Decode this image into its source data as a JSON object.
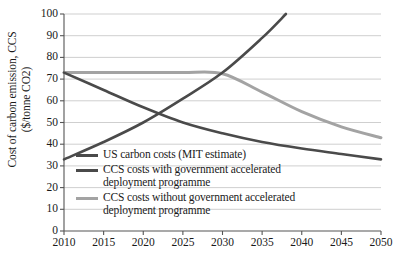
{
  "chart_data": {
    "type": "line",
    "title": "",
    "xlabel": "",
    "ylabel": "Cost of carbon emission, CCS\n($/tonne CO2)",
    "xlim": [
      2010,
      2050
    ],
    "ylim": [
      0,
      100
    ],
    "grid": true,
    "legend_position": "inside-lower-left",
    "xticks": [
      "2010",
      "2015",
      "2020",
      "2025",
      "2030",
      "2035",
      "2040",
      "2045",
      "2050"
    ],
    "yticks": [
      "0",
      "10",
      "20",
      "30",
      "40",
      "50",
      "60",
      "70",
      "80",
      "90",
      "100"
    ],
    "series": [
      {
        "name": "US carbon costs (MIT estimate)",
        "color": "#4a4a4a",
        "width": 2.6,
        "x": [
          2010,
          2015,
          2020,
          2025,
          2030,
          2035,
          2038
        ],
        "values": [
          33,
          41,
          50,
          61,
          73,
          89,
          100
        ]
      },
      {
        "name": "CCS costs with government accelerated\ndeployment programme",
        "color": "#4a4a4a",
        "width": 2.6,
        "x": [
          2010,
          2015,
          2020,
          2025,
          2030,
          2035,
          2040,
          2045,
          2050
        ],
        "values": [
          73,
          65,
          57,
          50,
          45,
          41,
          38,
          35.5,
          33
        ]
      },
      {
        "name": "CCS costs without government accelerated\ndeployment programme",
        "color": "#a3a3a3",
        "width": 3.0,
        "x": [
          2010,
          2015,
          2020,
          2025,
          2030,
          2035,
          2040,
          2045,
          2050
        ],
        "values": [
          73,
          73,
          73,
          73,
          72.5,
          64,
          55,
          48,
          43
        ]
      }
    ]
  },
  "legend": {
    "items": [
      {
        "label": "US carbon costs (MIT estimate)",
        "color": "#4a4a4a"
      },
      {
        "label": "CCS costs with government accelerated\ndeployment programme",
        "color": "#4a4a4a"
      },
      {
        "label": "CCS costs without government accelerated\ndeployment programme",
        "color": "#a3a3a3"
      }
    ]
  },
  "axes": {
    "y_title": "Cost of carbon emission, CCS\n($/tonne CO2)"
  },
  "colors": {
    "axis": "#555555",
    "grid": "#c9c9c9",
    "text": "#1a1a1a",
    "dark_series": "#4a4a4a",
    "light_series": "#a3a3a3"
  }
}
